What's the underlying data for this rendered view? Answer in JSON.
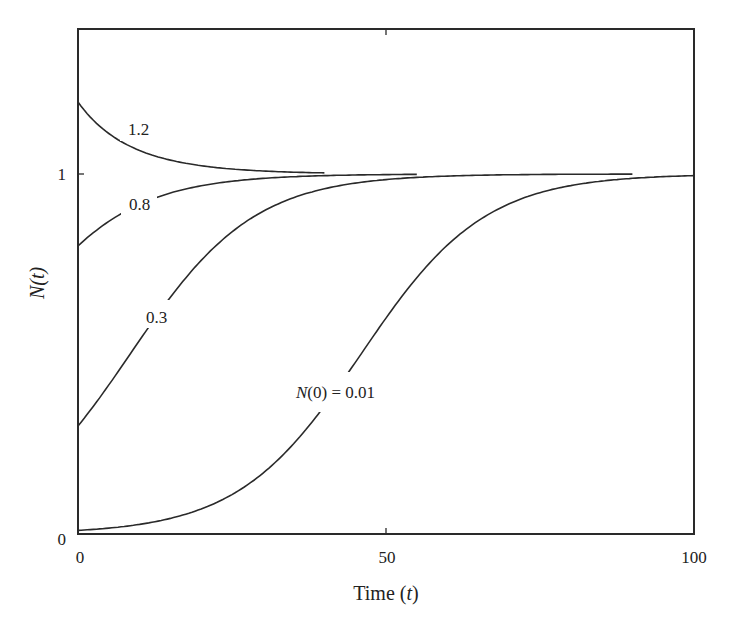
{
  "chart_data": {
    "type": "line",
    "title": "",
    "xlabel": "Time (t)",
    "ylabel": "N(t)",
    "xlim": [
      0,
      100
    ],
    "ylim": [
      0,
      1.25
    ],
    "grid": false,
    "legend": "none (inline curve labels)",
    "x_ticks": [
      0,
      50,
      100
    ],
    "x_tick_labels": [
      "0",
      "50",
      "100"
    ],
    "y_ticks": [
      0,
      1
    ],
    "y_tick_labels": [
      "0",
      "1"
    ],
    "model": "logistic N(t) = 1 / (1 + (1/N0 - 1) e^(-r t)), r ≈ 0.1",
    "growth_rate": 0.1,
    "series": [
      {
        "name": "1.2",
        "label": "1.2",
        "N0": 1.2,
        "t_end": 40,
        "x": [
          0,
          5,
          10,
          20,
          30,
          40
        ],
        "values": [
          1.2,
          1.11,
          1.07,
          1.02,
          1.01,
          1.0
        ],
        "label_t": 7.5,
        "label_dy": -7
      },
      {
        "name": "0.8",
        "label": "0.8",
        "N0": 0.8,
        "t_end": 55,
        "x": [
          0,
          5,
          10,
          20,
          30,
          55
        ],
        "values": [
          0.8,
          0.87,
          0.92,
          0.97,
          0.99,
          1.0
        ],
        "label_t": 7.5,
        "label_dy": 7
      },
      {
        "name": "0.3",
        "label": "0.3",
        "N0": 0.3,
        "t_end": 90,
        "x": [
          0,
          10,
          20,
          30,
          40,
          60,
          90
        ],
        "values": [
          0.3,
          0.54,
          0.76,
          0.9,
          0.96,
          0.99,
          1.0
        ],
        "label_t": 9,
        "label_dy": 0
      },
      {
        "name": "N(0) = 0.01",
        "label": "N(0) = 0.01",
        "N0": 0.01,
        "t_end": 100,
        "x": [
          0,
          10,
          20,
          30,
          40,
          46,
          50,
          60,
          70,
          80,
          100
        ],
        "values": [
          0.01,
          0.03,
          0.07,
          0.17,
          0.36,
          0.5,
          0.6,
          0.8,
          0.92,
          0.97,
          1.0
        ],
        "label_t": 40,
        "label_dy": 0
      }
    ]
  },
  "axes": {
    "xlabel_main": "Time (",
    "xlabel_var": "t",
    "xlabel_close": ")",
    "ylabel_main": "N",
    "ylabel_paren": "(t)"
  },
  "labels": {
    "c12": "1.2",
    "c08": "0.8",
    "c03": "0.3",
    "c001_var": "N",
    "c001_rest": "(0) = 0.01"
  },
  "ticks": {
    "x0": "0",
    "x50": "50",
    "x100": "100",
    "y0": "0",
    "y1": "1"
  },
  "colors": {
    "ink": "#2a2a2a",
    "background": "#ffffff"
  }
}
